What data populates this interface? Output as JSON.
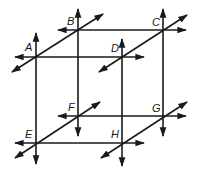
{
  "diagram": {
    "type": "geometry-figure",
    "stroke_color": "#1a1a1a",
    "background": "#ffffff",
    "points": [
      {
        "label": "A",
        "x": 36,
        "y": 57
      },
      {
        "label": "B",
        "x": 78,
        "y": 30
      },
      {
        "label": "C",
        "x": 163,
        "y": 30
      },
      {
        "label": "D",
        "x": 122,
        "y": 57
      },
      {
        "label": "E",
        "x": 36,
        "y": 143
      },
      {
        "label": "F",
        "x": 78,
        "y": 116
      },
      {
        "label": "G",
        "x": 163,
        "y": 116
      },
      {
        "label": "H",
        "x": 122,
        "y": 143
      }
    ],
    "lines": [
      {
        "name": "line-BC",
        "through": [
          "B",
          "C"
        ],
        "orientation": "horizontal"
      },
      {
        "name": "line-AD",
        "through": [
          "A",
          "D"
        ],
        "orientation": "horizontal"
      },
      {
        "name": "line-FG",
        "through": [
          "F",
          "G"
        ],
        "orientation": "horizontal"
      },
      {
        "name": "line-EH",
        "through": [
          "E",
          "H"
        ],
        "orientation": "horizontal"
      },
      {
        "name": "line-AE",
        "through": [
          "A",
          "E"
        ],
        "orientation": "vertical"
      },
      {
        "name": "line-BF",
        "through": [
          "B",
          "F"
        ],
        "orientation": "vertical"
      },
      {
        "name": "line-CG",
        "through": [
          "C",
          "G"
        ],
        "orientation": "vertical"
      },
      {
        "name": "line-DH",
        "through": [
          "D",
          "H"
        ],
        "orientation": "vertical"
      },
      {
        "name": "line-AB",
        "through": [
          "A",
          "B"
        ],
        "orientation": "diagonal"
      },
      {
        "name": "line-DC",
        "through": [
          "D",
          "C"
        ],
        "orientation": "diagonal"
      },
      {
        "name": "line-EF",
        "through": [
          "E",
          "F"
        ],
        "orientation": "diagonal"
      },
      {
        "name": "line-HG",
        "through": [
          "H",
          "G"
        ],
        "orientation": "diagonal"
      }
    ]
  },
  "labels": {
    "A": "A",
    "B": "B",
    "C": "C",
    "D": "D",
    "E": "E",
    "F": "F",
    "G": "G",
    "H": "H"
  }
}
